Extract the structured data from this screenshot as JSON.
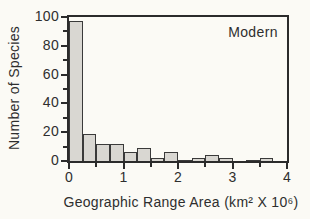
{
  "figure": {
    "annotation": "Modern",
    "y_axis_title": "Number of Species",
    "x_axis_title": "Geographic Range Area (km² X 10⁶)"
  },
  "chart_data": {
    "type": "bar",
    "title": "",
    "annotation": "Modern",
    "xlabel": "Geographic Range Area (km² X 10⁶)",
    "ylabel": "Number of Species",
    "xlim": [
      0,
      4
    ],
    "ylim": [
      0,
      100
    ],
    "grid": false,
    "legend": "none",
    "bin_width": 0.25,
    "bins": [
      {
        "start": 0.0,
        "count": 97
      },
      {
        "start": 0.25,
        "count": 19
      },
      {
        "start": 0.5,
        "count": 12
      },
      {
        "start": 0.75,
        "count": 12
      },
      {
        "start": 1.0,
        "count": 6
      },
      {
        "start": 1.25,
        "count": 9
      },
      {
        "start": 1.5,
        "count": 2
      },
      {
        "start": 1.75,
        "count": 6
      },
      {
        "start": 2.0,
        "count": 1
      },
      {
        "start": 2.25,
        "count": 2
      },
      {
        "start": 2.5,
        "count": 4
      },
      {
        "start": 2.75,
        "count": 2
      },
      {
        "start": 3.0,
        "count": 0
      },
      {
        "start": 3.25,
        "count": 1
      },
      {
        "start": 3.5,
        "count": 2
      },
      {
        "start": 3.75,
        "count": 0
      }
    ],
    "x_major_ticks": [
      {
        "value": 0,
        "label": "0"
      },
      {
        "value": 1,
        "label": "1"
      },
      {
        "value": 2,
        "label": "2"
      },
      {
        "value": 3,
        "label": "3"
      },
      {
        "value": 4,
        "label": "4"
      }
    ],
    "x_minor_ticks": [
      0.5,
      1.5,
      2.5,
      3.5
    ],
    "y_major_ticks": [
      {
        "value": 0,
        "label": "0"
      },
      {
        "value": 20,
        "label": "20"
      },
      {
        "value": 40,
        "label": "40"
      },
      {
        "value": 60,
        "label": "60"
      },
      {
        "value": 80,
        "label": "80"
      },
      {
        "value": 100,
        "label": "100"
      }
    ],
    "y_minor_ticks": [
      10,
      30,
      50,
      70,
      90
    ],
    "colors": {
      "background": "#fbfaf5",
      "bar_fill": "#d9d7d2",
      "bar_border": "#3a3a3a",
      "axis": "#2b2b2b",
      "text": "#2e2e2e"
    }
  }
}
